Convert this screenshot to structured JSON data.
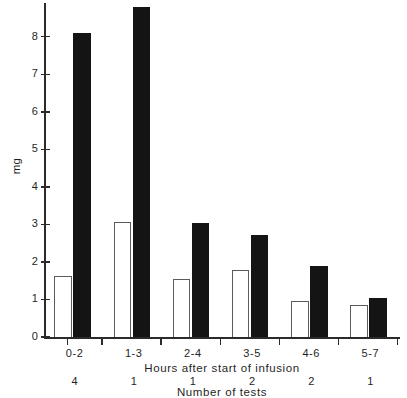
{
  "chart_data": {
    "type": "bar",
    "title": "",
    "xlabel": "Hours after start of infusion",
    "ylabel": "mg",
    "categories": [
      "0-2",
      "1-3",
      "2-4",
      "3-5",
      "4-6",
      "5-7"
    ],
    "series": [
      {
        "name": "open",
        "style": "white-outlined",
        "values": [
          1.63,
          3.07,
          1.55,
          1.78,
          0.95,
          0.85
        ]
      },
      {
        "name": "filled",
        "style": "black-filled",
        "values": [
          8.1,
          8.8,
          3.05,
          2.73,
          1.9,
          1.05
        ]
      }
    ],
    "ylim": [
      0,
      8.9
    ],
    "y_ticks": [
      0,
      1,
      2,
      3,
      4,
      5,
      6,
      7,
      8
    ],
    "y_tick_labels": [
      "0",
      "1",
      "2",
      "3",
      "4",
      "5",
      "6",
      "7",
      "8"
    ],
    "grid": false,
    "legend": "none",
    "secondary_axis": {
      "label": "Number of tests",
      "values": [
        "4",
        "1",
        "1",
        "2",
        "2",
        "1"
      ]
    },
    "colors": {
      "filled_bar": "#141414",
      "open_bar_border": "#5b5b5b",
      "open_bar_fill": "#ffffff",
      "axis": "#2b2b2b",
      "text": "#1f1f1f",
      "background": "#ffffff"
    }
  }
}
